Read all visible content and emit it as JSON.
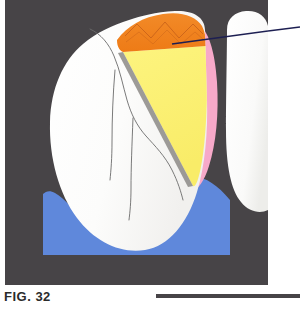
{
  "figure": {
    "caption": "FIG. 32",
    "frame_color": "#474447",
    "background_color": "#ffffff"
  },
  "illustration": {
    "title": "Tooth cross-section with restoration",
    "regions": [
      {
        "name": "gingiva",
        "label": "Gingiva",
        "color": "#5f88db",
        "description": "Blue wavy band across the lower portion of the frame"
      },
      {
        "name": "main-tooth-enamel",
        "label": "Tooth enamel",
        "color": "#fbfbfa",
        "description": "Large white tooth body occupying left and center"
      },
      {
        "name": "adjacent-tooth",
        "label": "Adjacent tooth",
        "color": "#ffffff",
        "description": "Partial white tooth at right edge of frame"
      },
      {
        "name": "restoration-orange",
        "label": "Restoration surface",
        "color": "#f0801f",
        "description": "Orange occlusal cap region at top of tooth with zigzag margin detail"
      },
      {
        "name": "dentin-wedge",
        "label": "Dentin wedge",
        "color": "#fbf073",
        "description": "Yellow triangular wedge beneath the orange cap"
      },
      {
        "name": "periodontal-band",
        "label": "Periodontal band",
        "color": "#f7a9c9",
        "description": "Pink band along the distal (right) contour of the tooth"
      }
    ],
    "line_colors": {
      "anatomy_lines": "#6b6b6b",
      "leader_line": "#1d1f52",
      "shadow": "#8c8a86"
    },
    "callout": {
      "label": "",
      "leader_from_x": 172,
      "leader_from_y": 44,
      "leader_to_x": 300,
      "leader_to_y": 31
    }
  }
}
